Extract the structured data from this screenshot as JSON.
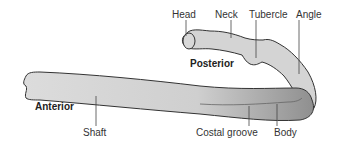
{
  "diagram": {
    "labels": {
      "head": "Head",
      "neck": "Neck",
      "tubercle": "Tubercle",
      "angle": "Angle",
      "posterior": "Posterior",
      "anterior": "Anterior",
      "shaft": "Shaft",
      "costal_groove": "Costal groove",
      "body": "Body"
    },
    "colors": {
      "bone_fill": "#d6d6d6",
      "bone_shade": "#9a9a9a",
      "outline": "#333333",
      "leader_line": "#444444"
    }
  }
}
